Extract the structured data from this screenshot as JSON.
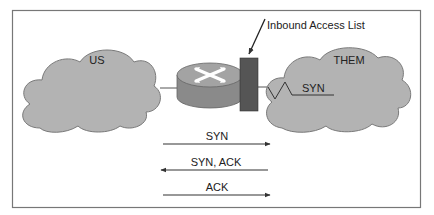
{
  "diagram": {
    "nodes": {
      "us_cloud": {
        "label": "US"
      },
      "them_cloud": {
        "label": "THEM"
      },
      "router": {
        "label": ""
      },
      "firewall": {
        "label": "Inbound Access List"
      }
    },
    "inbound_packet": {
      "label": "SYN"
    },
    "handshake": [
      {
        "label": "SYN",
        "direction": "right"
      },
      {
        "label": "SYN, ACK",
        "direction": "left"
      },
      {
        "label": "ACK",
        "direction": "right"
      }
    ],
    "colors": {
      "cloud_fill": "#b3b3b3",
      "cloud_stroke": "#7a7a7a",
      "router_top": "#9a9a9a",
      "router_side": "#8a8a8a",
      "firewall": "#555555",
      "frame": "#777777",
      "text": "#222222"
    }
  }
}
